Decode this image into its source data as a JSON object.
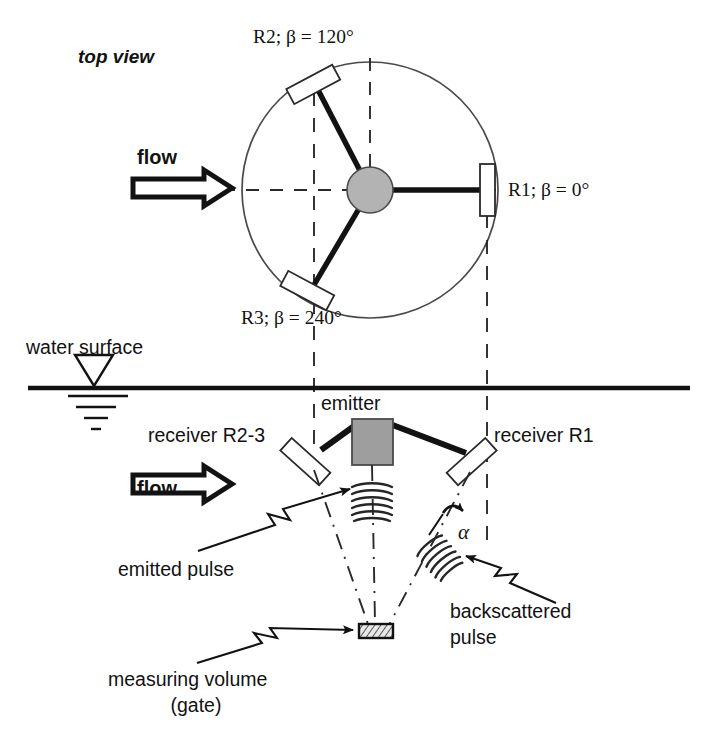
{
  "figure": {
    "title_top_view": "top view",
    "colors": {
      "ink": "#121212",
      "hub_fill": "#b3b3b3",
      "emitter_fill": "#9e9e9e",
      "receiver_fill": "#ffffff",
      "gate_fill": "#d8d8d8",
      "background": "#ffffff"
    }
  },
  "top_view": {
    "view_label": "top view",
    "flow_label": "flow",
    "receivers": [
      {
        "id": "R1",
        "label": "R1; β = 0°",
        "beta_deg": 0
      },
      {
        "id": "R2",
        "label": "R2; β = 120°",
        "beta_deg": 120
      },
      {
        "id": "R3",
        "label": "R3; β = 240°",
        "beta_deg": 240
      }
    ]
  },
  "side_view": {
    "water_surface_label": "water surface",
    "flow_label": "flow",
    "emitter_label": "emitter",
    "receiver_left_label": "receiver R2-3",
    "receiver_right_label": "receiver R1",
    "angle_label": "α",
    "emitted_pulse_label": "emitted pulse",
    "backscattered_pulse_label_line1": "backscattered",
    "backscattered_pulse_label_line2": "pulse",
    "measuring_volume_label_line1": "measuring volume",
    "measuring_volume_label_line2": "(gate)"
  }
}
